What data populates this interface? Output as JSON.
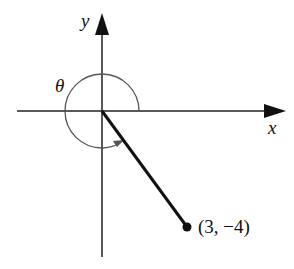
{
  "diagram": {
    "type": "angle-in-standard-position",
    "axes": {
      "x_label": "x",
      "y_label": "y"
    },
    "angle_label": "θ",
    "point": {
      "label": "(3, −4)",
      "x": 3,
      "y": -4
    },
    "colors": {
      "axis": "#222222",
      "arc": "#555555",
      "segment": "#111111",
      "point": "#111111"
    }
  }
}
